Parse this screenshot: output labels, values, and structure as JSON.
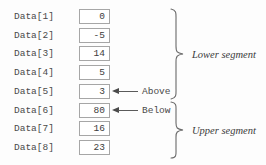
{
  "diagram": {
    "colors": {
      "background": "#fdfdfd",
      "box_border": "#a6a6a6",
      "box_fill": "#ffffff",
      "text": "#4a4a4a",
      "brace": "#6a6a6a"
    },
    "rows": [
      {
        "label": "Data[1]",
        "value": "0"
      },
      {
        "label": "Data[2]",
        "value": "-5"
      },
      {
        "label": "Data[3]",
        "value": "14"
      },
      {
        "label": "Data[4]",
        "value": "5"
      },
      {
        "label": "Data[5]",
        "value": "3"
      },
      {
        "label": "Data[6]",
        "value": "80"
      },
      {
        "label": "Data[7]",
        "value": "16"
      },
      {
        "label": "Data[8]",
        "value": "23"
      }
    ],
    "pointers": [
      {
        "label": "Above",
        "target_row": "Data[5]"
      },
      {
        "label": "Below",
        "target_row": "Data[6]"
      }
    ],
    "segments": [
      {
        "label": "Lower segment",
        "rows": "Data[1]-Data[5]"
      },
      {
        "label": "Upper segment",
        "rows": "Data[6]-Data[8]"
      }
    ]
  }
}
